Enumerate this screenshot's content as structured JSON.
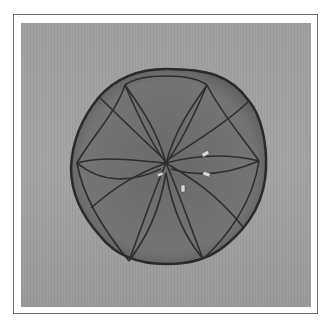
{
  "image": {
    "subject": "wire-mesh occluder device photographed on gray background",
    "colors": {
      "background": "#a0a0a0",
      "device_fill": "#707070",
      "wire": "#2e2e2e",
      "marker": "#d8d8d8",
      "frame": "#6e6e6e"
    }
  }
}
